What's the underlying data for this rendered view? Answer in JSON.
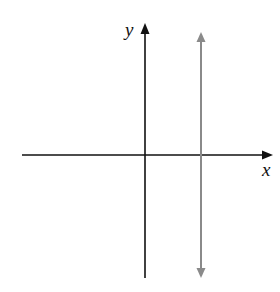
{
  "diagram": {
    "x_axis": {
      "label": "x",
      "color": "#111111"
    },
    "y_axis": {
      "label": "y",
      "color": "#111111"
    },
    "vertical_line": {
      "color": "#8a8a8a",
      "arrows": "both ends",
      "position": "right of y-axis (x = positive constant)"
    }
  }
}
